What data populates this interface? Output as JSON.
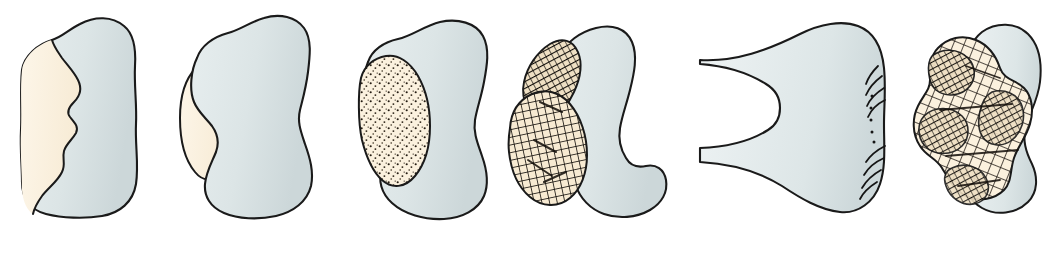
{
  "figure": {
    "width": 1063,
    "height": 274,
    "background_color": "#ffffff"
  },
  "colors": {
    "bone_gray": "#dde5e6",
    "bone_gray_shadow": "#c9d4d6",
    "cartilage_cream": "#fbf1de",
    "cartilage_cream_deep": "#f6e9cf",
    "outline": "#1a1a1a",
    "hatch": "#14100c",
    "stipple": "#2a2118",
    "label_color": "#1c1c20",
    "page_background": "#ffffff"
  },
  "stages": [
    {
      "id": "stage-1",
      "label": "I",
      "label_x": 80,
      "roman_value": 1,
      "fill_regions": [
        "bone_gray",
        "cartilage_cream"
      ],
      "texture": "none",
      "parts": 1
    },
    {
      "id": "stage-2",
      "label": "II",
      "label_x": 264,
      "roman_value": 2,
      "fill_regions": [
        "bone_gray",
        "cartilage_cream"
      ],
      "texture": "none",
      "parts": 2
    },
    {
      "id": "stage-3",
      "label": "III",
      "label_x": 440,
      "roman_value": 3,
      "fill_regions": [
        "bone_gray",
        "cartilage_cream"
      ],
      "texture": "stipple",
      "parts": 2
    },
    {
      "id": "stage-4",
      "label": "IV",
      "label_x": 614,
      "roman_value": 4,
      "fill_regions": [
        "bone_gray",
        "cartilage_cream"
      ],
      "texture": "cross-hatch",
      "parts": 2
    },
    {
      "id": "stage-5",
      "label": "V",
      "label_x": 898,
      "roman_value": 5,
      "fill_regions": [
        "bone_gray",
        "cartilage_cream"
      ],
      "texture": "cross-hatch-and-ridges",
      "parts": 2
    }
  ]
}
